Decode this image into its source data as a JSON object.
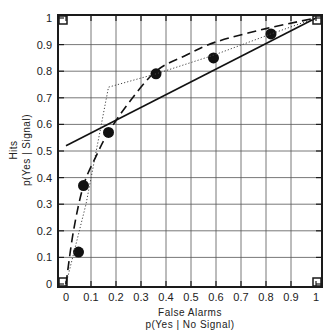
{
  "chart_data": {
    "type": "line",
    "title": "",
    "xlabel": "False Alarms",
    "xlabel_sub": "p(Yes | No Signal)",
    "ylabel": "Hits",
    "ylabel_sub": "p(Yes | Signal)",
    "xlim": [
      0,
      1
    ],
    "ylim": [
      0,
      1
    ],
    "grid": true,
    "legend": null,
    "x_ticks": [
      "0",
      "0.1",
      "0.2",
      "0.3",
      "0.4",
      "0.5",
      "0.6",
      "0.7",
      "0.8",
      "0.9",
      "1"
    ],
    "y_ticks": [
      "0",
      "0.1",
      "0.2",
      "0.3",
      "0.4",
      "0.5",
      "0.6",
      "0.7",
      "0.8",
      "0.9",
      "1"
    ],
    "series": [
      {
        "name": "observed points",
        "style": "scatter",
        "points": [
          [
            0.05,
            0.12
          ],
          [
            0.07,
            0.37
          ],
          [
            0.17,
            0.57
          ],
          [
            0.36,
            0.79
          ],
          [
            0.59,
            0.85
          ],
          [
            0.82,
            0.94
          ]
        ]
      },
      {
        "name": "linear fit",
        "style": "solid",
        "points": [
          [
            0.0,
            0.52
          ],
          [
            1.0,
            1.0
          ]
        ]
      },
      {
        "name": "piecewise (dotted)",
        "style": "dotted",
        "points": [
          [
            0.0,
            0.0
          ],
          [
            0.08,
            0.3
          ],
          [
            0.17,
            0.74
          ],
          [
            0.36,
            0.79
          ],
          [
            0.59,
            0.86
          ],
          [
            0.82,
            0.94
          ],
          [
            1.0,
            1.0
          ]
        ]
      },
      {
        "name": "ROC curve (dashed)",
        "style": "dashed",
        "points": [
          [
            0.0,
            0.0
          ],
          [
            0.03,
            0.2
          ],
          [
            0.07,
            0.37
          ],
          [
            0.12,
            0.48
          ],
          [
            0.17,
            0.57
          ],
          [
            0.25,
            0.68
          ],
          [
            0.36,
            0.8
          ],
          [
            0.48,
            0.86
          ],
          [
            0.6,
            0.91
          ],
          [
            0.8,
            0.96
          ],
          [
            1.0,
            1.0
          ]
        ]
      }
    ]
  }
}
